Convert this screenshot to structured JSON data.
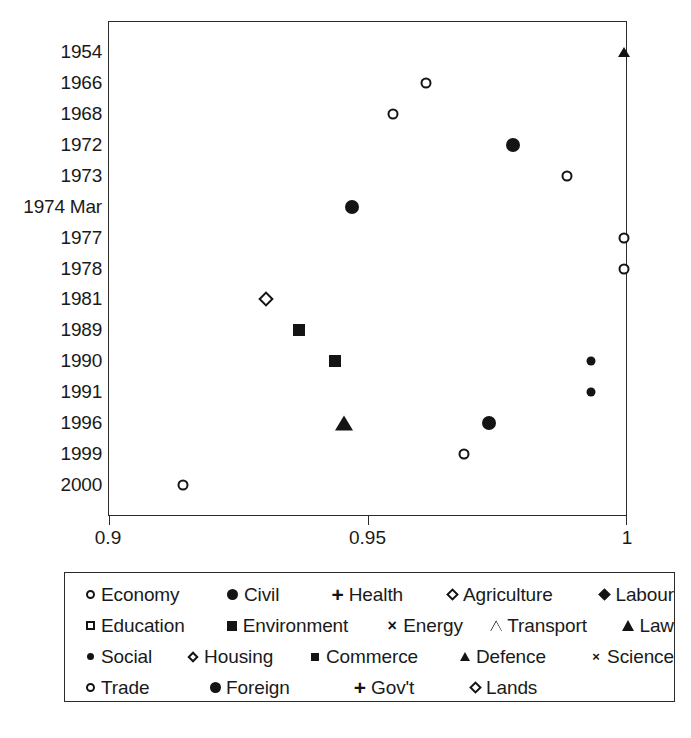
{
  "chart_data": {
    "type": "scatter",
    "title": "",
    "xlabel": "",
    "ylabel": "",
    "xlim": [
      0.9,
      1.0
    ],
    "xticks": [
      "0.9",
      "0.95",
      "1"
    ],
    "xtick_values": [
      0.9,
      0.95,
      1.0
    ],
    "grid": false,
    "legend_position": "below",
    "categories": [
      "1954",
      "1966",
      "1968",
      "1972",
      "1973",
      "1974 Mar",
      "1977",
      "1978",
      "1981",
      "1989",
      "1990",
      "1991",
      "1996",
      "1999",
      "2000"
    ],
    "points": [
      {
        "year": "1954",
        "value": 0.9995,
        "series": "Defence",
        "marker": "triangle-filled-small"
      },
      {
        "year": "1966",
        "value": 0.9613,
        "series": "Economy",
        "marker": "circle-open"
      },
      {
        "year": "1968",
        "value": 0.955,
        "series": "Economy",
        "marker": "circle-open"
      },
      {
        "year": "1972",
        "value": 0.978,
        "series": "Civil",
        "marker": "circle-filled"
      },
      {
        "year": "1973",
        "value": 0.9885,
        "series": "Economy",
        "marker": "circle-open"
      },
      {
        "year": "1974 Mar",
        "value": 0.947,
        "series": "Civil",
        "marker": "circle-filled"
      },
      {
        "year": "1977",
        "value": 0.9995,
        "series": "Economy",
        "marker": "circle-open"
      },
      {
        "year": "1978",
        "value": 0.9995,
        "series": "Economy",
        "marker": "circle-open"
      },
      {
        "year": "1981",
        "value": 0.9305,
        "series": "Agriculture",
        "marker": "diamond-open"
      },
      {
        "year": "1989",
        "value": 0.9368,
        "series": "Environment",
        "marker": "square-filled"
      },
      {
        "year": "1990",
        "value": 0.9437,
        "series": "Environment",
        "marker": "square-filled"
      },
      {
        "year": "1990",
        "value": 0.993,
        "series": "Social",
        "marker": "dot-small"
      },
      {
        "year": "1991",
        "value": 0.993,
        "series": "Social",
        "marker": "dot-small"
      },
      {
        "year": "1996",
        "value": 0.9455,
        "series": "Law",
        "marker": "triangle-filled"
      },
      {
        "year": "1996",
        "value": 0.9735,
        "series": "Foreign",
        "marker": "circle-filled"
      },
      {
        "year": "1999",
        "value": 0.9685,
        "series": "Economy",
        "marker": "circle-open"
      },
      {
        "year": "2000",
        "value": 0.9145,
        "series": "Economy",
        "marker": "circle-open"
      }
    ],
    "legend": [
      {
        "label": "Economy",
        "marker": "circle-open"
      },
      {
        "label": "Civil",
        "marker": "circle-filled"
      },
      {
        "label": "Health",
        "marker": "plus"
      },
      {
        "label": "Agriculture",
        "marker": "diamond-open"
      },
      {
        "label": "Labour",
        "marker": "diamond-filled"
      },
      {
        "label": "Education",
        "marker": "square-open"
      },
      {
        "label": "Environment",
        "marker": "square-filled"
      },
      {
        "label": "Energy",
        "marker": "cross"
      },
      {
        "label": "Transport",
        "marker": "triangle-open"
      },
      {
        "label": "Law",
        "marker": "triangle-filled"
      },
      {
        "label": "Social",
        "marker": "dot-small"
      },
      {
        "label": "Housing",
        "marker": "diamond-open-small"
      },
      {
        "label": "Commerce",
        "marker": "square-small"
      },
      {
        "label": "Defence",
        "marker": "triangle-filled-small"
      },
      {
        "label": "Science",
        "marker": "cross-small"
      },
      {
        "label": "Trade",
        "marker": "circle-open"
      },
      {
        "label": "Foreign",
        "marker": "circle-filled"
      },
      {
        "label": "Gov't",
        "marker": "plus"
      },
      {
        "label": "Lands",
        "marker": "diamond-open"
      }
    ]
  },
  "colors": {
    "marker": "#141414",
    "axis": "#2b2b2b",
    "background": "#ffffff"
  }
}
